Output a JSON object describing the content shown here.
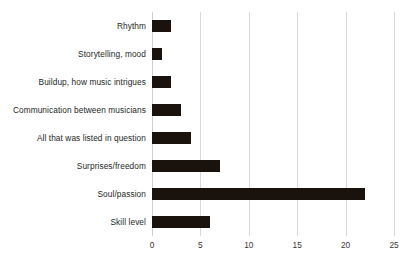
{
  "chart_data": {
    "type": "bar",
    "orientation": "horizontal",
    "title": "",
    "subtitle": "",
    "xlabel": "",
    "ylabel": "",
    "xlim": [
      0,
      25
    ],
    "xticks": [
      0,
      5,
      10,
      15,
      20,
      25
    ],
    "grid": true,
    "legend": false,
    "legend_position": "none",
    "bar_color": "#1a120c",
    "gridline_color": "#d9d9d9",
    "background_color": "#ffffff",
    "categories": [
      "Rhythm",
      "Storytelling, mood",
      "Buildup, how music intrigues",
      "Communication between musicians",
      "All that was listed in question",
      "Surprises/freedom",
      "Soul/passion",
      "Skill level"
    ],
    "values": [
      2,
      1,
      2,
      3,
      4,
      7,
      22,
      6
    ]
  }
}
